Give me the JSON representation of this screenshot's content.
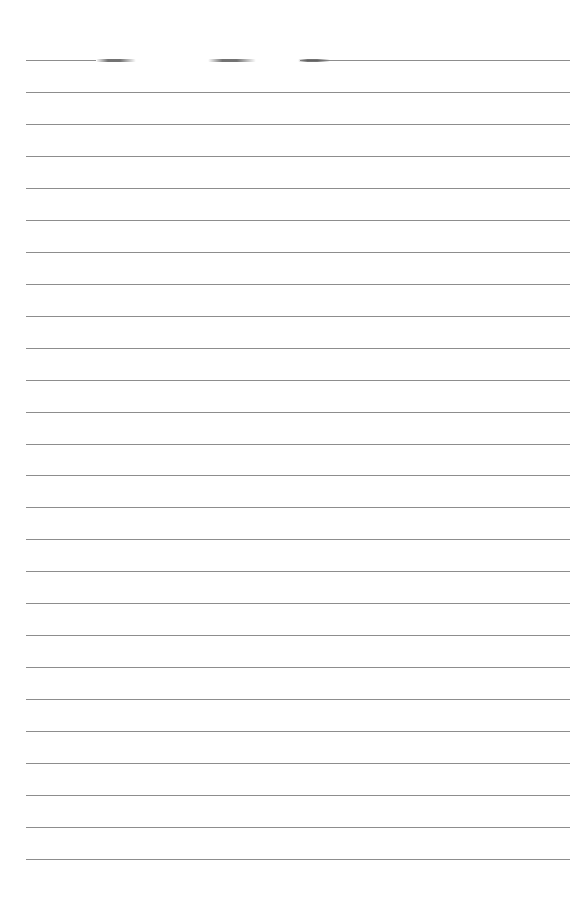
{
  "page": {
    "type": "lined-paper",
    "background_color": "#ffffff",
    "line_color": "#8d8d8d",
    "line_count": 26,
    "first_line_y": 60,
    "line_spacing": 31.96,
    "line_left": 26,
    "line_right": 570,
    "top_line_segments": [
      {
        "x": 26,
        "w": 70
      },
      {
        "x": 300,
        "w": 270
      }
    ],
    "top_line_smudges": [
      {
        "x": 96,
        "w": 40
      },
      {
        "x": 208,
        "w": 48
      },
      {
        "x": 298,
        "w": 32
      }
    ]
  }
}
